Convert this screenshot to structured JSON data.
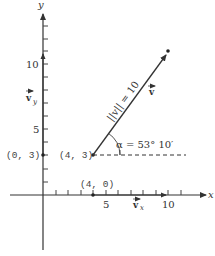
{
  "diagram": {
    "axes": {
      "x_label": "x",
      "y_label": "y",
      "x_ticks": [
        "5",
        "10"
      ],
      "y_ticks": [
        "5",
        "10"
      ]
    },
    "points": {
      "origin_point": "(4, 3)",
      "y_intercept_point": "(0, 3)",
      "x_projection_point": "(4, 0)"
    },
    "vector": {
      "name": "v",
      "magnitude_label": "||v|| = 10",
      "angle_label": "α = 53° 10′",
      "x_component_label": "v",
      "x_component_sub": "x",
      "y_component_label": "v",
      "y_component_sub": "y",
      "start": [
        4,
        3
      ],
      "end": [
        10,
        11
      ]
    },
    "colors": {
      "ink": "#333333",
      "background": "#ffffff"
    }
  }
}
